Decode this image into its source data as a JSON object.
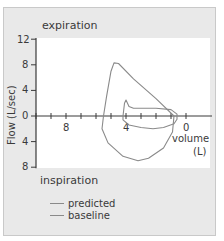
{
  "chart_data": {
    "type": "line",
    "title": "",
    "top_annotation": "expiration",
    "bottom_annotation": "inspiration",
    "xlabel": "volume (L)",
    "xlabel_line1": "volume",
    "xlabel_line2": "(L)",
    "ylabel": "Flow (L/sec)",
    "xlim": [
      10.0,
      -1.5
    ],
    "ylim": [
      -8,
      12
    ],
    "x_reversed": true,
    "x_ticks": [
      {
        "value": 8,
        "label": "8"
      },
      {
        "value": 4,
        "label": "4"
      },
      {
        "value": 0,
        "label": "0"
      }
    ],
    "x_minor_ticks": [
      10,
      9,
      8,
      7,
      6,
      5,
      4,
      3,
      2,
      1,
      0
    ],
    "y_ticks": [
      {
        "value": 12,
        "label": "12"
      },
      {
        "value": 8,
        "label": "8"
      },
      {
        "value": 4,
        "label": "4"
      },
      {
        "value": 0,
        "label": "0"
      },
      {
        "value": -4,
        "label": "4"
      },
      {
        "value": -8,
        "label": "8"
      }
    ],
    "grid": false,
    "legend_position": "bottom-left",
    "series": [
      {
        "name": "predicted",
        "color": "#8a8a8a",
        "points": [
          [
            5.5,
            0
          ],
          [
            5.3,
            3
          ],
          [
            5.0,
            7
          ],
          [
            4.8,
            8.3
          ],
          [
            4.5,
            8.2
          ],
          [
            3.5,
            5.8
          ],
          [
            2.0,
            2.7
          ],
          [
            0.8,
            0
          ],
          [
            0.9,
            -2.5
          ],
          [
            1.5,
            -5
          ],
          [
            2.5,
            -6.6
          ],
          [
            3.2,
            -7
          ],
          [
            4.2,
            -6.3
          ],
          [
            5.2,
            -4.2
          ],
          [
            5.6,
            -2
          ],
          [
            5.5,
            0
          ]
        ]
      },
      {
        "name": "baseline",
        "color": "#8a8a8a",
        "points": [
          [
            4.2,
            0
          ],
          [
            4.1,
            2.0
          ],
          [
            4.0,
            2.5
          ],
          [
            3.8,
            1.5
          ],
          [
            3.5,
            1.2
          ],
          [
            2.0,
            1.2
          ],
          [
            1.0,
            1.0
          ],
          [
            0.6,
            0.3
          ],
          [
            0.6,
            -0.5
          ],
          [
            0.8,
            -1.2
          ],
          [
            1.5,
            -1.8
          ],
          [
            2.2,
            -2.0
          ],
          [
            3.0,
            -1.8
          ],
          [
            3.8,
            -1.4
          ],
          [
            4.2,
            -0.6
          ],
          [
            4.2,
            0
          ]
        ]
      }
    ]
  },
  "legend": {
    "items": [
      {
        "label": "predicted",
        "color": "#8a8a8a"
      },
      {
        "label": "baseline",
        "color": "#8a8a8a"
      }
    ]
  },
  "colors": {
    "frame_bg": "#e9e9e9",
    "plot_bg": "#ffffff",
    "axis": "#3a3a3a",
    "curve": "#8a8a8a"
  }
}
